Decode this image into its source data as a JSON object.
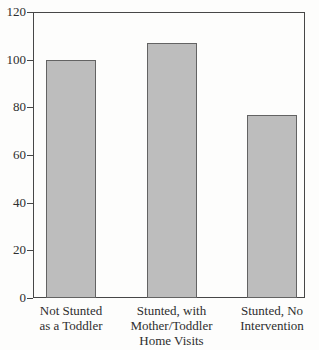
{
  "chart_data": {
    "type": "bar",
    "categories": [
      "Not Stunted\nas a Toddler",
      "Stunted, with\nMother/Toddler\nHome Visits",
      "Stunted, No\nIntervention"
    ],
    "values": [
      100,
      107,
      77
    ],
    "title": "",
    "xlabel": "",
    "ylabel": "",
    "ylim": [
      0,
      120
    ],
    "yticks": [
      0,
      20,
      40,
      60,
      80,
      100,
      120
    ],
    "grid": false,
    "legend": "none",
    "colors": {
      "bar_fill": "#bdbdbd",
      "bar_border": "#636363",
      "axis_frame": "#474747",
      "text": "#2e2e2e",
      "background": "#fdfdfc"
    }
  }
}
